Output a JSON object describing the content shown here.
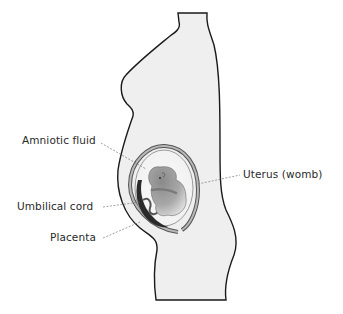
{
  "diagram": {
    "type": "anatomical-illustration",
    "labels": [
      {
        "id": "amniotic-fluid",
        "text": "Amniotic fluid",
        "side": "left"
      },
      {
        "id": "umbilical-cord",
        "text": "Umbilical cord",
        "side": "left"
      },
      {
        "id": "placenta",
        "text": "Placenta",
        "side": "left"
      },
      {
        "id": "uterus",
        "text": "Uterus (womb)",
        "side": "right"
      }
    ],
    "colors": {
      "body_fill": "#efefef",
      "outline": "#1a1a1a",
      "uterus_wall": "#9a9a9a",
      "fetus_dark": "#6a6a6a",
      "fetus_light": "#d8d8d8",
      "placenta": "#2a2a2a",
      "leader_line": "#777777",
      "label_text": "#2a2a2a"
    }
  }
}
